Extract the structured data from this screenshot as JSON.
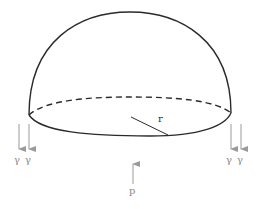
{
  "diagram": {
    "labels": {
      "radius": "r",
      "pressure": "p",
      "left_tension_1": "γ",
      "left_tension_2": "γ",
      "right_tension_1": "γ",
      "right_tension_2": "γ"
    },
    "colors": {
      "outline": "#2a2a2a",
      "arrows": "#9a9a9a",
      "label": "#8a8a8a"
    }
  }
}
